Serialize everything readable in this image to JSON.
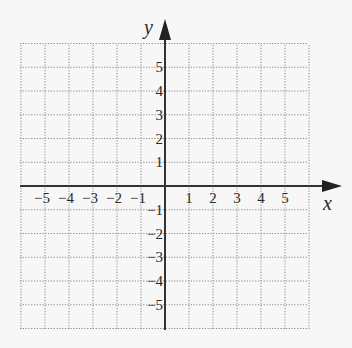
{
  "chart_data": {
    "type": "coordinate-grid",
    "title": "",
    "xlabel": "x",
    "ylabel": "y",
    "xlim": [
      -6,
      6
    ],
    "ylim": [
      -6,
      6
    ],
    "grid": true,
    "grid_style": "dotted",
    "x_tick_labels": [
      "−5",
      "−4",
      "−3",
      "−2",
      "−1",
      "1",
      "2",
      "3",
      "4",
      "5"
    ],
    "x_tick_values": [
      -5,
      -4,
      -3,
      -2,
      -1,
      1,
      2,
      3,
      4,
      5
    ],
    "y_tick_labels": [
      "5",
      "4",
      "3",
      "2",
      "1",
      "−1",
      "−2",
      "−3",
      "−4",
      "−5"
    ],
    "y_tick_values": [
      5,
      4,
      3,
      2,
      1,
      -1,
      -2,
      -3,
      -4,
      -5
    ],
    "series": []
  },
  "labels": {
    "x_axis": "x",
    "y_axis": "y"
  },
  "colors": {
    "background": "#f7f7f7",
    "grid": "#8a8a8a",
    "axis": "#333333"
  }
}
